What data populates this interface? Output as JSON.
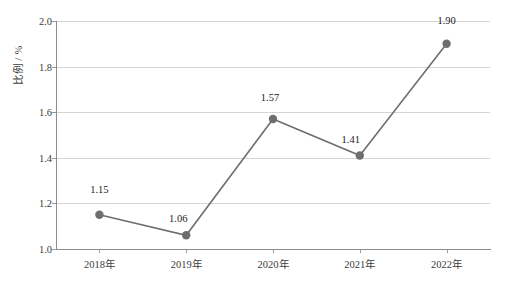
{
  "chart_data": {
    "type": "line",
    "title": "",
    "xlabel": "",
    "ylabel": "比例 / %",
    "categories": [
      "2018年",
      "2019年",
      "2020年",
      "2021年",
      "2022年"
    ],
    "values": [
      1.15,
      1.06,
      1.57,
      1.41,
      1.9
    ],
    "point_labels": [
      "1.15",
      "1.06",
      "1.57",
      "1.41",
      "1.90"
    ],
    "ylim": [
      1.0,
      2.0
    ],
    "ytick_labels": [
      "1.0",
      "1.2",
      "1.4",
      "1.6",
      "1.8",
      "2.0"
    ],
    "ytick_values": [
      1.0,
      1.2,
      1.4,
      1.6,
      1.8,
      2.0
    ],
    "grid": true,
    "legend": false,
    "series_color": "#6e6e6e",
    "marker_color": "#6e6e6e",
    "grid_color": "#d4d4d4",
    "axis_color": "#8c8c8c",
    "background_color": "#ffffff"
  }
}
